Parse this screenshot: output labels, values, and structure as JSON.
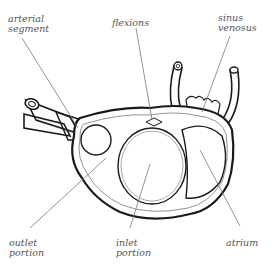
{
  "figure": {
    "labels": {
      "arterial_segment": "arterial\nsegment",
      "flexions": "flexions",
      "sinus_venosus": "sinus\nvenosus",
      "outlet_portion": "outlet\nportion",
      "inlet_portion": "inlet\nportion",
      "atrium": "atrium"
    }
  },
  "colors": {
    "outline": "#1a1a1a",
    "leader_line": "#777777",
    "label_text": "#555555",
    "background": "#ffffff"
  }
}
